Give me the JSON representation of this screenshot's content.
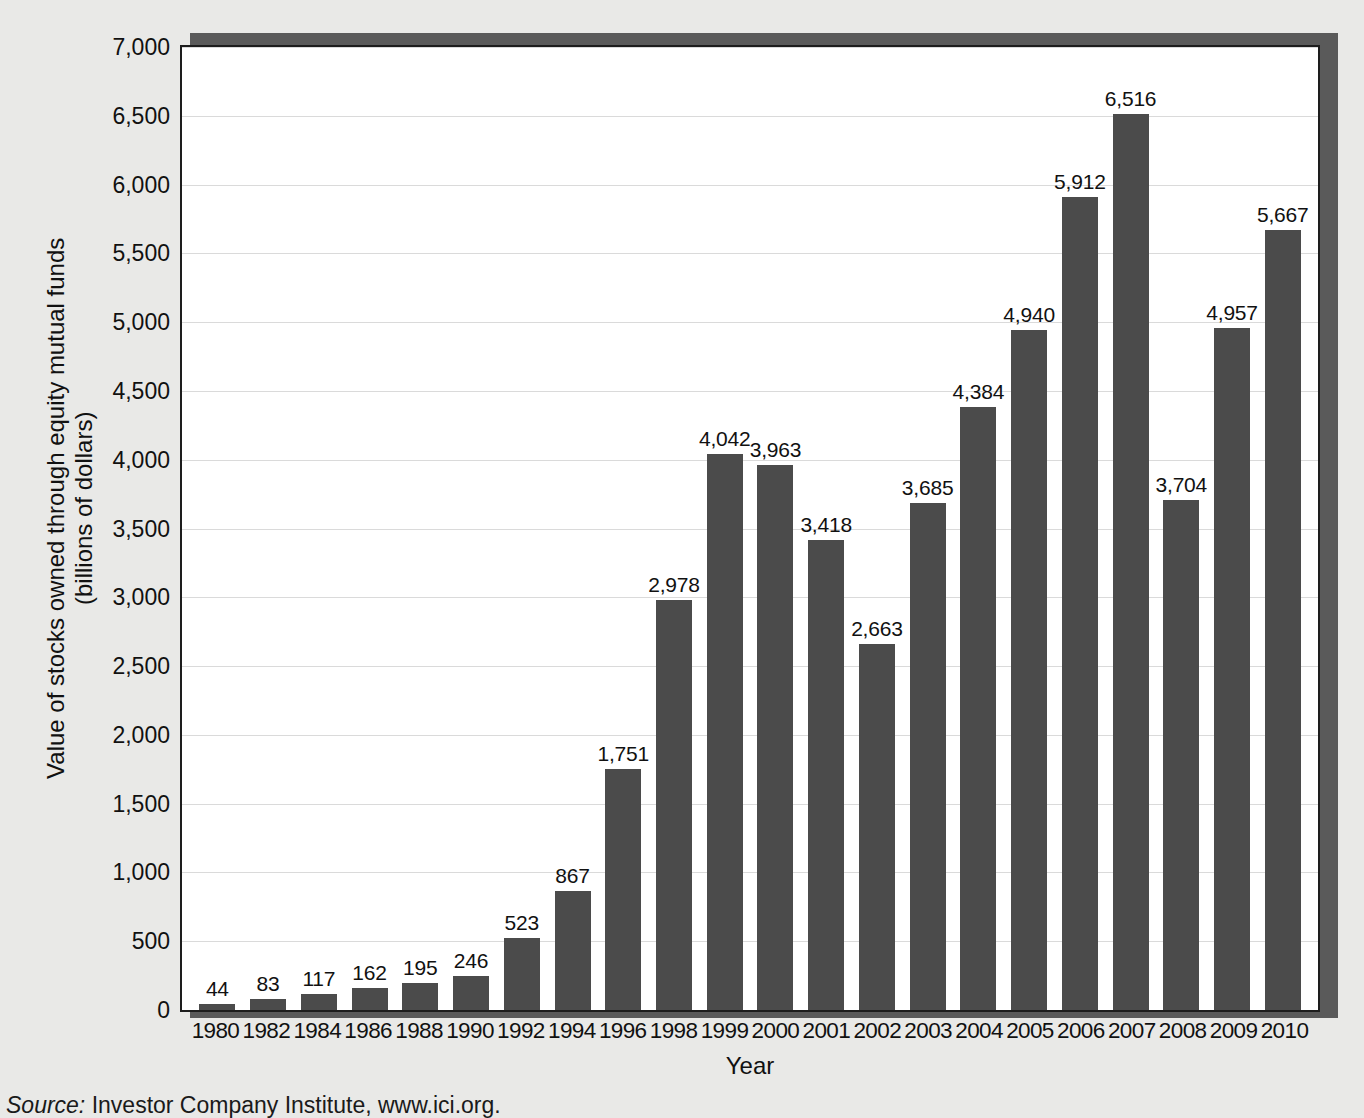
{
  "chart_data": {
    "type": "bar",
    "title": "",
    "xlabel": "Year",
    "ylabel_line1": "Value of stocks owned through equity mutual funds",
    "ylabel_line2": "(billions of dollars)",
    "ylim": [
      0,
      7000
    ],
    "grid": true,
    "legend": "none",
    "bar_color": "#4b4b4b",
    "plot_background": "#ffffff",
    "page_background": "#e9e9e7",
    "gridline_color": "#dadada",
    "yticks": [
      {
        "value": 7000,
        "label": "7,000"
      },
      {
        "value": 6500,
        "label": "6,500"
      },
      {
        "value": 6000,
        "label": "6,000"
      },
      {
        "value": 5500,
        "label": "5,500"
      },
      {
        "value": 5000,
        "label": "5,000"
      },
      {
        "value": 4500,
        "label": "4,500"
      },
      {
        "value": 4000,
        "label": "4,000"
      },
      {
        "value": 3500,
        "label": "3,500"
      },
      {
        "value": 3000,
        "label": "3,000"
      },
      {
        "value": 2500,
        "label": "2,500"
      },
      {
        "value": 2000,
        "label": "2,000"
      },
      {
        "value": 1500,
        "label": "1,500"
      },
      {
        "value": 1000,
        "label": "1,000"
      },
      {
        "value": 500,
        "label": "500"
      },
      {
        "value": 0,
        "label": "0"
      }
    ],
    "categories": [
      "1980",
      "1982",
      "1984",
      "1986",
      "1988",
      "1990",
      "1992",
      "1994",
      "1996",
      "1998",
      "1999",
      "2000",
      "2001",
      "2002",
      "2003",
      "2004",
      "2005",
      "2006",
      "2007",
      "2008",
      "2009",
      "2010"
    ],
    "values": [
      44,
      83,
      117,
      162,
      195,
      246,
      523,
      867,
      1751,
      2978,
      4042,
      3963,
      3418,
      2663,
      3685,
      4384,
      4940,
      5912,
      6516,
      3704,
      4957,
      5667
    ],
    "value_labels": [
      "44",
      "83",
      "117",
      "162",
      "195",
      "246",
      "523",
      "867",
      "1,751",
      "2,978",
      "4,042",
      "3,963",
      "3,418",
      "2,663",
      "3,685",
      "4,384",
      "4,940",
      "5,912",
      "6,516",
      "3,704",
      "4,957",
      "5,667"
    ]
  },
  "source": {
    "prefix": "Source:",
    "text": " Investor Company Institute, www.ici.org."
  }
}
